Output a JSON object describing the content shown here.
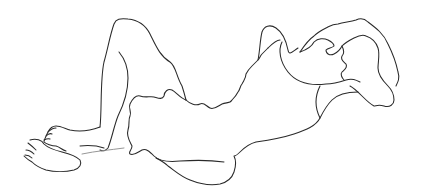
{
  "image": {
    "description": "Continuous-line sketch of a reclining nude figure lying on its back, knees raised, with wavy hair spread to the right",
    "background_color": "#ffffff",
    "stroke_color": "#2a2a2a",
    "elements": [
      {
        "name": "raised-leg",
        "label": "raised bent leg"
      },
      {
        "name": "back-leg",
        "label": "second leg behind"
      },
      {
        "name": "foot-upper",
        "label": "upper foot with toes"
      },
      {
        "name": "foot-lower",
        "label": "lower foot with toes"
      },
      {
        "name": "torso",
        "label": "torso with ruffled edge"
      },
      {
        "name": "arm",
        "label": "arm reaching up"
      },
      {
        "name": "head-hair",
        "label": "head with flowing hair"
      }
    ]
  }
}
